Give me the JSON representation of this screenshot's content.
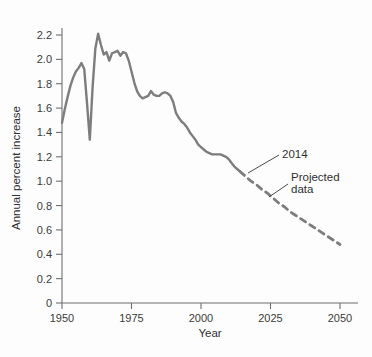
{
  "chart_data": {
    "type": "line",
    "title": "",
    "xlabel": "Year",
    "ylabel": "Annual percent increase",
    "xlim": [
      1950,
      2050
    ],
    "ylim": [
      0,
      2.3
    ],
    "xticks": [
      1950,
      1975,
      2000,
      2025,
      2050
    ],
    "xtick_labels": [
      "1950",
      "1975",
      "2000",
      "2025",
      "2050"
    ],
    "yticks": [
      0,
      0.2,
      0.4,
      0.6,
      0.8,
      1.0,
      1.2,
      1.4,
      1.6,
      1.8,
      2.0,
      2.2
    ],
    "ytick_labels": [
      "0",
      "0.2",
      "0.4",
      "0.6",
      "0.8",
      "1.0",
      "1.2",
      "1.4",
      "1.6",
      "1.8",
      "2.0",
      "2.2"
    ],
    "grid": false,
    "legend": false,
    "line_color": "#7d7d7d",
    "series": [
      {
        "name": "Observed data",
        "style": "solid",
        "x": [
          1950,
          1951,
          1952,
          1953,
          1954,
          1955,
          1956,
          1957,
          1958,
          1959,
          1960,
          1961,
          1962,
          1963,
          1964,
          1965,
          1966,
          1967,
          1968,
          1969,
          1970,
          1971,
          1972,
          1973,
          1974,
          1975,
          1976,
          1977,
          1978,
          1979,
          1980,
          1981,
          1982,
          1983,
          1984,
          1985,
          1986,
          1987,
          1988,
          1989,
          1990,
          1991,
          1992,
          1993,
          1994,
          1995,
          1996,
          1997,
          1998,
          1999,
          2000,
          2001,
          2002,
          2003,
          2004,
          2005,
          2006,
          2007,
          2008,
          2009,
          2010,
          2011,
          2012,
          2013,
          2014
        ],
        "y": [
          1.48,
          1.59,
          1.69,
          1.78,
          1.85,
          1.9,
          1.93,
          1.97,
          1.92,
          1.64,
          1.34,
          1.77,
          2.09,
          2.21,
          2.12,
          2.04,
          2.06,
          1.99,
          2.05,
          2.06,
          2.07,
          2.03,
          2.06,
          2.05,
          1.99,
          1.9,
          1.81,
          1.74,
          1.7,
          1.68,
          1.69,
          1.7,
          1.74,
          1.71,
          1.7,
          1.7,
          1.72,
          1.73,
          1.72,
          1.7,
          1.65,
          1.56,
          1.52,
          1.49,
          1.47,
          1.44,
          1.4,
          1.37,
          1.34,
          1.3,
          1.28,
          1.26,
          1.24,
          1.23,
          1.22,
          1.22,
          1.22,
          1.22,
          1.21,
          1.2,
          1.18,
          1.15,
          1.12,
          1.1,
          1.08
        ]
      },
      {
        "name": "Projected data",
        "style": "dashed",
        "x": [
          2014,
          2016,
          2018,
          2020,
          2022,
          2024,
          2026,
          2028,
          2030,
          2032,
          2034,
          2036,
          2038,
          2040,
          2042,
          2044,
          2046,
          2048,
          2050
        ],
        "y": [
          1.08,
          1.04,
          1.0,
          0.97,
          0.93,
          0.9,
          0.86,
          0.82,
          0.79,
          0.75,
          0.72,
          0.69,
          0.66,
          0.63,
          0.6,
          0.57,
          0.54,
          0.51,
          0.48
        ]
      }
    ],
    "annotations": [
      {
        "name": "transition-year",
        "text": "2014",
        "label_x": 282,
        "label_y": 158,
        "leader_from_x": 279,
        "leader_from_y": 155,
        "leader_to_x": 248,
        "leader_to_y": 173
      },
      {
        "name": "projected-data-note",
        "text_line1": "Projected",
        "text_line2": "data",
        "label_x": 291,
        "label_y": 181,
        "label2_y": 193,
        "leader_from_x": 288,
        "leader_from_y": 184,
        "leader_to_x": 269,
        "leader_to_y": 197
      }
    ]
  }
}
